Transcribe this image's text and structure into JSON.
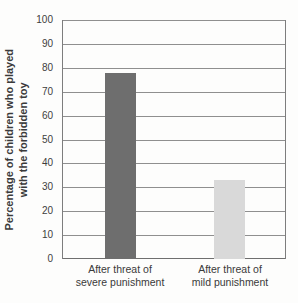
{
  "chart_data": {
    "type": "bar",
    "categories": [
      "After threat of severe punishment",
      "After threat of mild punishment"
    ],
    "values": [
      78,
      33
    ],
    "title": "",
    "xlabel": "",
    "ylabel": "Percentage of children who played with the forbidden toy",
    "ylim": [
      0,
      100
    ],
    "yticks": [
      100,
      90,
      80,
      70,
      60,
      50,
      40,
      30,
      20,
      10,
      0
    ],
    "grid": true,
    "legend": "none",
    "bar_colors": [
      "#6e6e6e",
      "#d9d9d9"
    ]
  },
  "labels": {
    "ylabel_line1": "Percentage of children who played",
    "ylabel_line2": "with the forbidden toy",
    "cat_severe_line1": "After threat of",
    "cat_severe_line2": "severe punishment",
    "cat_mild_line1": "After threat of",
    "cat_mild_line2": "mild punishment"
  },
  "colors": {
    "severe_bar": "#6e6e6e",
    "mild_bar": "#d9d9d9",
    "gridline": "#8f8f8f",
    "text": "#3a3a3a",
    "background": "#fdfdfc"
  }
}
